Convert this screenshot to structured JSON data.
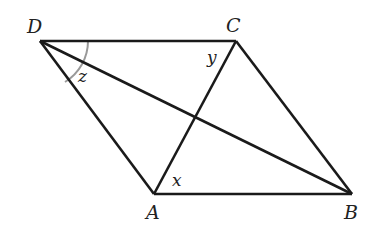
{
  "diagram": {
    "type": "parallelogram with diagonals",
    "vertices": {
      "D": {
        "label": "D",
        "x": 40,
        "y": 41
      },
      "C": {
        "label": "C",
        "x": 236,
        "y": 41
      },
      "A": {
        "label": "A",
        "x": 154,
        "y": 194
      },
      "B": {
        "label": "B",
        "x": 352,
        "y": 194
      }
    },
    "edges": [
      "DC",
      "CB",
      "BA",
      "AD"
    ],
    "diagonals": [
      "DB",
      "AC"
    ],
    "angles": {
      "z": {
        "label": "z",
        "vertex": "D",
        "between": "DA and DB"
      },
      "y": {
        "label": "y",
        "vertex": "C",
        "between": "CD and CA"
      },
      "x": {
        "label": "x",
        "vertex": "A",
        "between": "AC and AB"
      }
    },
    "arc": {
      "vertex": "D",
      "from": "DC",
      "to": "DA",
      "color": "#999999"
    },
    "line_color": "#1a1a1a"
  }
}
